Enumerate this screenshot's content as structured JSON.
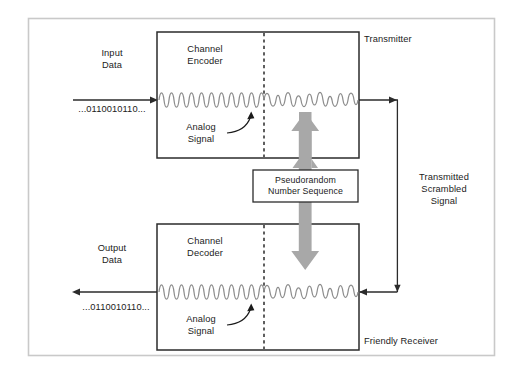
{
  "figure": {
    "title_semantic": "scrambling-descrambling-block-diagram",
    "frame_color": "#c9c9c9",
    "box_border_color": "#2b2b2b",
    "wave_color": "#8c8c8c",
    "arrow_gray": "#a8a8a8",
    "text_color": "#1b1b1b"
  },
  "transmitter": {
    "section_label": "Transmitter",
    "box_label_line1": "Channel",
    "box_label_line2": "Encoder",
    "input_label_line1": "Input",
    "input_label_line2": "Data",
    "input_bits": "...0110010110...",
    "analog_label_line1": "Analog",
    "analog_label_line2": "Signal"
  },
  "receiver": {
    "section_label": "Friendly Receiver",
    "box_label_line1": "Channel",
    "box_label_line2": "Decoder",
    "output_label_line1": "Output",
    "output_label_line2": "Data",
    "output_bits": "...0110010110...",
    "analog_label_line1": "Analog",
    "analog_label_line2": "Signal"
  },
  "prns": {
    "line1": "Pseudorandom",
    "line2": "Number Sequence"
  },
  "channel": {
    "label_line1": "Transmitted",
    "label_line2": "Scrambled",
    "label_line3": "Signal"
  }
}
